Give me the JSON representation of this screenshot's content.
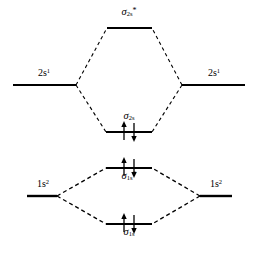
{
  "diagram": {
    "kind": "molecular-orbital-energy-diagram",
    "width": 258,
    "height": 255,
    "background_color": "#ffffff",
    "line_color": "#000000",
    "levels": [
      {
        "id": "sigma-2s-star",
        "label_sigma": "σ",
        "label_sub": "2s",
        "label_star": "*",
        "label_text": "σ2s*",
        "type": "molecular-antibonding",
        "x1": 107,
        "x2": 152,
        "y": 28,
        "electrons": 0,
        "label_x": 129,
        "label_y": 9,
        "label_position": "above"
      },
      {
        "id": "atomic-2s-left",
        "label_base": "2s",
        "label_sup": "1",
        "label_text": "2s1",
        "type": "atomic",
        "x1": 13,
        "x2": 76,
        "y": 85,
        "electrons": 0,
        "label_x": 44,
        "label_y": 70,
        "label_position": "above"
      },
      {
        "id": "atomic-2s-right",
        "label_base": "2s",
        "label_sup": "1",
        "label_text": "2s1",
        "type": "atomic",
        "x1": 182,
        "x2": 245,
        "y": 85,
        "electrons": 0,
        "label_x": 214,
        "label_y": 70,
        "label_position": "above"
      },
      {
        "id": "sigma-2s",
        "label_sigma": "σ",
        "label_sub": "2s",
        "label_star": "",
        "label_text": "σ2s",
        "type": "molecular-bonding",
        "x1": 106,
        "x2": 152,
        "y": 132,
        "electrons": 2,
        "label_x": 129,
        "label_y": 113,
        "label_position": "above"
      },
      {
        "id": "sigma-1s-star",
        "label_sigma": "σ",
        "label_sub": "1s",
        "label_star": "*",
        "label_text": "σ1s*",
        "type": "molecular-antibonding",
        "x1": 106,
        "x2": 152,
        "y": 168,
        "electrons": 2,
        "label_x": 129,
        "label_y": 172,
        "label_position": "below"
      },
      {
        "id": "atomic-1s-left",
        "label_base": "1s",
        "label_sup": "2",
        "label_text": "1s2",
        "type": "atomic",
        "x1": 27,
        "x2": 57,
        "y": 196,
        "electrons": 0,
        "label_x": 43,
        "label_y": 181,
        "label_position": "above"
      },
      {
        "id": "atomic-1s-right",
        "label_base": "1s",
        "label_sup": "2",
        "label_text": "1s2",
        "type": "atomic",
        "x1": 200,
        "x2": 232,
        "y": 196,
        "electrons": 0,
        "label_x": 216,
        "label_y": 181,
        "label_position": "above"
      },
      {
        "id": "sigma-1s",
        "label_sigma": "σ",
        "label_sub": "1s",
        "label_star": "",
        "label_text": "σ1s",
        "type": "molecular-bonding",
        "x1": 106,
        "x2": 152,
        "y": 224,
        "electrons": 2,
        "label_x": 129,
        "label_y": 228,
        "label_position": "below"
      }
    ],
    "correlation_lines": [
      {
        "id": "conn-2s-left-up",
        "x1": 76,
        "y1": 85,
        "x2": 107,
        "y2": 28
      },
      {
        "id": "conn-2s-right-up",
        "x1": 182,
        "y1": 85,
        "x2": 152,
        "y2": 28
      },
      {
        "id": "conn-2s-left-down",
        "x1": 76,
        "y1": 85,
        "x2": 106,
        "y2": 132
      },
      {
        "id": "conn-2s-right-down",
        "x1": 182,
        "y1": 85,
        "x2": 152,
        "y2": 132
      },
      {
        "id": "conn-1s-left-up",
        "x1": 57,
        "y1": 196,
        "x2": 106,
        "y2": 168
      },
      {
        "id": "conn-1s-right-up",
        "x1": 200,
        "y1": 196,
        "x2": 152,
        "y2": 168
      },
      {
        "id": "conn-1s-left-down",
        "x1": 57,
        "y1": 196,
        "x2": 106,
        "y2": 224
      },
      {
        "id": "conn-1s-right-down",
        "x1": 200,
        "y1": 196,
        "x2": 152,
        "y2": 224
      }
    ],
    "electron_pairs": [
      {
        "id": "pair-sigma-2s",
        "level": "sigma-2s",
        "up_x": 124,
        "down_x": 134,
        "y": 132,
        "arrow_length": 17
      },
      {
        "id": "pair-sigma-1s-star",
        "level": "sigma-1s-star",
        "up_x": 124,
        "down_x": 134,
        "y": 168,
        "arrow_length": 17
      },
      {
        "id": "pair-sigma-1s",
        "level": "sigma-1s",
        "up_x": 124,
        "down_x": 134,
        "y": 224,
        "arrow_length": 17
      }
    ]
  }
}
